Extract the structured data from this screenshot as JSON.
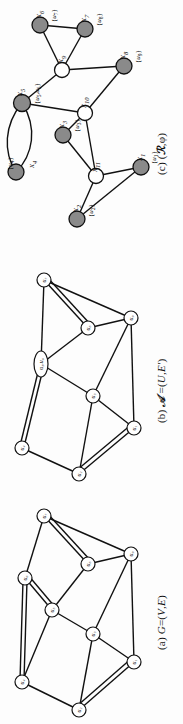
{
  "figure": {
    "orientation": "rotated-90-ccw",
    "panels": [
      {
        "id": "c",
        "caption": "(c) (ℛ,φ)",
        "caption_label": "(c)",
        "caption_body": "(ℛ,φ)",
        "nodes": [
          {
            "id": "x1",
            "label": "x1",
            "set": "{u1}",
            "fill": "gray",
            "x": 141,
            "y": 167
          },
          {
            "id": "x2",
            "label": "x2",
            "set": "{u2}",
            "fill": "gray",
            "x": 77,
            "y": 219
          },
          {
            "id": "x3",
            "label": "x3",
            "set": "{u3}",
            "fill": "gray",
            "x": 63,
            "y": 135
          },
          {
            "id": "x4",
            "label": "x4",
            "set": "{u4}",
            "fill": "gray",
            "x": 16,
            "y": 172
          },
          {
            "id": "x5",
            "label": "x5",
            "set": "{u5,u6}",
            "fill": "gray",
            "x": 22,
            "y": 103
          },
          {
            "id": "x6",
            "label": "x6",
            "set": "{u7}",
            "fill": "gray",
            "x": 40,
            "y": 25
          },
          {
            "id": "x7",
            "label": "x7",
            "set": "{u8}",
            "fill": "gray",
            "x": 85,
            "y": 29
          },
          {
            "id": "x8",
            "label": "x8",
            "set": "{u9}",
            "fill": "gray",
            "x": 124,
            "y": 66
          },
          {
            "id": "x9",
            "label": "x9",
            "set": "",
            "fill": "white",
            "x": 62,
            "y": 70
          },
          {
            "id": "x10",
            "label": "x10",
            "set": "",
            "fill": "white",
            "x": 85,
            "y": 113
          },
          {
            "id": "x11",
            "label": "x11",
            "set": "",
            "fill": "white",
            "x": 96,
            "y": 176
          }
        ],
        "edges": [
          [
            "x6",
            "x7"
          ],
          [
            "x6",
            "x9"
          ],
          [
            "x7",
            "x9"
          ],
          [
            "x9",
            "x8"
          ],
          [
            "x9",
            "x5"
          ],
          [
            "x8",
            "x10"
          ],
          [
            "x5",
            "x10"
          ],
          [
            "x5",
            "x4"
          ],
          [
            "x5",
            "x4"
          ],
          [
            "x10",
            "x3"
          ],
          [
            "x10",
            "x11"
          ],
          [
            "x3",
            "x11"
          ],
          [
            "x11",
            "x1"
          ],
          [
            "x11",
            "x2"
          ],
          [
            "x2",
            "x1"
          ]
        ]
      },
      {
        "id": "b",
        "caption": "(b) 𝒜 =(U,E')",
        "caption_label": "(b)",
        "caption_body": "𝒜 =(U,E')",
        "nodes": [
          {
            "id": "u1",
            "label": "u1",
            "shape": "circle",
            "x": 134,
            "y": 180
          },
          {
            "id": "u2",
            "label": "u2",
            "shape": "circle",
            "x": 79,
            "y": 226
          },
          {
            "id": "u3",
            "label": "u3",
            "shape": "circle",
            "x": 93,
            "y": 148
          },
          {
            "id": "u4",
            "label": "u4",
            "shape": "circle",
            "x": 22,
            "y": 200
          },
          {
            "id": "u56",
            "label": "u5,u6",
            "shape": "ellipse",
            "x": 41,
            "y": 116
          },
          {
            "id": "u7",
            "label": "u7",
            "shape": "circle",
            "x": 44,
            "y": 32
          },
          {
            "id": "u8",
            "label": "u8",
            "shape": "circle",
            "x": 88,
            "y": 80
          },
          {
            "id": "u9",
            "label": "u9",
            "shape": "circle",
            "x": 131,
            "y": 70
          }
        ],
        "edges": [
          [
            "u7",
            "u8"
          ],
          [
            "u7",
            "u8"
          ],
          [
            "u7",
            "u9"
          ],
          [
            "u7",
            "u56"
          ],
          [
            "u8",
            "u9"
          ],
          [
            "u8",
            "u56"
          ],
          [
            "u9",
            "u3"
          ],
          [
            "u9",
            "u1"
          ],
          [
            "u56",
            "u3"
          ],
          [
            "u56",
            "u4"
          ],
          [
            "u56",
            "u4"
          ],
          [
            "u3",
            "u1"
          ],
          [
            "u3",
            "u2"
          ],
          [
            "u4",
            "u2"
          ],
          [
            "u1",
            "u2"
          ],
          [
            "u1",
            "u2"
          ]
        ]
      },
      {
        "id": "a",
        "caption": "(a) G=(V,E)",
        "caption_label": "(a)",
        "caption_body": "G=(V,E)",
        "nodes": [
          {
            "id": "u1",
            "label": "u1",
            "shape": "circle",
            "x": 134,
            "y": 180
          },
          {
            "id": "u2",
            "label": "u2",
            "shape": "circle",
            "x": 79,
            "y": 228
          },
          {
            "id": "u3",
            "label": "u3",
            "shape": "circle",
            "x": 93,
            "y": 152
          },
          {
            "id": "u4",
            "label": "u4",
            "shape": "circle",
            "x": 22,
            "y": 200
          },
          {
            "id": "u5",
            "label": "u5",
            "shape": "circle",
            "x": 52,
            "y": 128
          },
          {
            "id": "u6",
            "label": "u6",
            "shape": "circle",
            "x": 25,
            "y": 96
          },
          {
            "id": "u7",
            "label": "u7",
            "shape": "circle",
            "x": 44,
            "y": 34
          },
          {
            "id": "u8",
            "label": "u8",
            "shape": "circle",
            "x": 88,
            "y": 82
          },
          {
            "id": "u9",
            "label": "u9",
            "shape": "circle",
            "x": 131,
            "y": 72
          }
        ],
        "edges": [
          [
            "u7",
            "u8"
          ],
          [
            "u7",
            "u8"
          ],
          [
            "u7",
            "u9"
          ],
          [
            "u7",
            "u6"
          ],
          [
            "u8",
            "u9"
          ],
          [
            "u8",
            "u5"
          ],
          [
            "u9",
            "u3"
          ],
          [
            "u9",
            "u1"
          ],
          [
            "u6",
            "u5"
          ],
          [
            "u6",
            "u4"
          ],
          [
            "u6",
            "u4"
          ],
          [
            "u5",
            "u3"
          ],
          [
            "u5",
            "u4"
          ],
          [
            "u3",
            "u1"
          ],
          [
            "u3",
            "u2"
          ],
          [
            "u4",
            "u2"
          ],
          [
            "u1",
            "u2"
          ],
          [
            "u1",
            "u2"
          ]
        ]
      }
    ],
    "colors": {
      "node_gray": "#8a8a8a",
      "node_white": "#ffffff",
      "stroke": "#111111",
      "background": "#fdfdfd"
    }
  }
}
